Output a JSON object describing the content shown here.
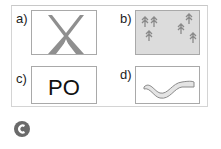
{
  "panels": [
    {
      "label": "a)",
      "icon": "tent-icon",
      "fill": "#ffffff"
    },
    {
      "label": "b)",
      "icon": "forest-icon",
      "fill": "#dcdcdc"
    },
    {
      "label": "c)",
      "text": "PO",
      "fill": "#ffffff"
    },
    {
      "label": "d)",
      "icon": "river-icon",
      "fill": "#ffffff"
    }
  ],
  "badge": {
    "letter": "C",
    "color": "#6a6a6a"
  }
}
